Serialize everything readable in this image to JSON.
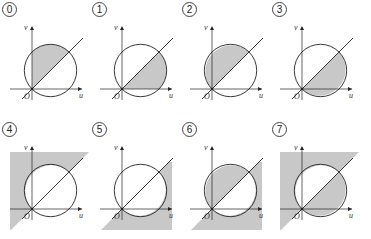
{
  "panels": [
    {
      "label": "0",
      "shade": "circle-above-line"
    },
    {
      "label": "1",
      "shade": "circle-below-line"
    },
    {
      "label": "2",
      "shade": "circle-above-line-full"
    },
    {
      "label": "3",
      "shade": "circle-below-line-full"
    },
    {
      "label": "4",
      "shade": "outside-circle-above-line"
    },
    {
      "label": "5",
      "shade": "outside-circle-below-line"
    },
    {
      "label": "6",
      "shade": "outside-circle-below-line-with-circle-left"
    },
    {
      "label": "7",
      "shade": "outside-circle-above-line-with-circle-bottom"
    }
  ],
  "axes": {
    "x_label": "u",
    "y_label": "v",
    "origin_label": "O"
  },
  "colors": {
    "shade": "#c8c8c8",
    "stroke": "#222222"
  }
}
